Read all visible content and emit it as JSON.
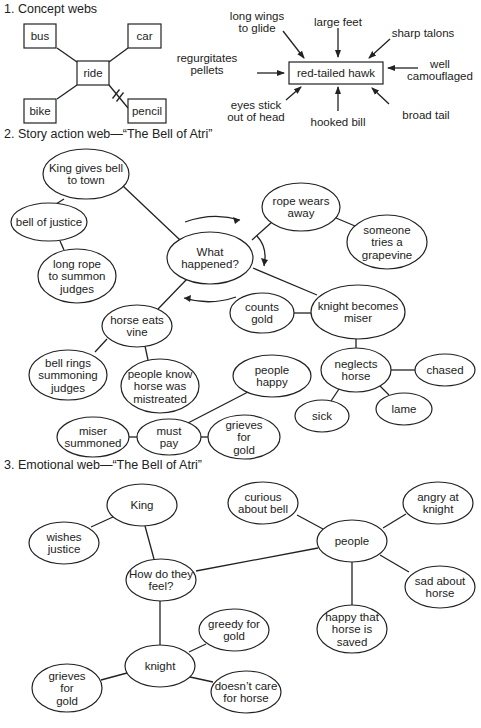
{
  "sections": [
    {
      "id": "concept",
      "heading": "1. Concept webs",
      "heading_pos": [
        4,
        13
      ]
    },
    {
      "id": "story",
      "heading": "2. Story action web—“The Bell of Atri”",
      "heading_pos": [
        4,
        138
      ]
    },
    {
      "id": "emotional",
      "heading": "3. Emotional web—“The Bell of Atri”",
      "heading_pos": [
        4,
        469
      ]
    }
  ],
  "concept_web": {
    "center": {
      "label": "ride",
      "x": 77,
      "y": 61,
      "w": 32,
      "h": 24
    },
    "nodes": [
      {
        "label": "bus",
        "x": 24,
        "y": 24,
        "w": 32,
        "h": 24,
        "edge_from": [
          57,
          48
        ],
        "edge_to": [
          77,
          62
        ]
      },
      {
        "label": "car",
        "x": 128,
        "y": 24,
        "w": 33,
        "h": 24,
        "edge_from": [
          128,
          48
        ],
        "edge_to": [
          109,
          62
        ]
      },
      {
        "label": "bike",
        "x": 24,
        "y": 99,
        "w": 32,
        "h": 24,
        "edge_from": [
          57,
          99
        ],
        "edge_to": [
          77,
          85
        ]
      },
      {
        "label": "pencil",
        "x": 128,
        "y": 99,
        "w": 38,
        "h": 24,
        "edge_from": [
          128,
          108
        ],
        "edge_to": [
          109,
          85
        ],
        "broken": true
      }
    ]
  },
  "hawk_web": {
    "center": {
      "label": "red-tailed hawk",
      "x": 289,
      "y": 62,
      "w": 94,
      "h": 22
    },
    "attributes": [
      {
        "label": [
          "long wings",
          "to glide"
        ],
        "tx": 257,
        "ty": 22,
        "arrow": [
          283,
          31,
          304,
          58
        ]
      },
      {
        "label": [
          "large feet"
        ],
        "tx": 338,
        "ty": 22,
        "arrow": [
          338,
          28,
          338,
          57
        ]
      },
      {
        "label": [
          "sharp talons"
        ],
        "tx": 423,
        "ty": 33,
        "arrow": [
          390,
          39,
          369,
          58
        ]
      },
      {
        "label": [
          "regurgitates",
          "pellets"
        ],
        "tx": 207,
        "ty": 64,
        "arrow": [
          257,
          73,
          284,
          73
        ]
      },
      {
        "label": [
          "well",
          "camouflaged"
        ],
        "tx": 440,
        "ty": 70,
        "arrow": [
          418,
          68,
          388,
          68
        ]
      },
      {
        "label": [
          "eyes stick",
          "out of head"
        ],
        "tx": 256,
        "ty": 111,
        "arrow": [
          286,
          100,
          301,
          87
        ]
      },
      {
        "label": [
          "hooked bill"
        ],
        "tx": 338,
        "ty": 122,
        "arrow": [
          338,
          111,
          338,
          87
        ]
      },
      {
        "label": [
          "broad tail"
        ],
        "tx": 426,
        "ty": 115,
        "arrow": [
          389,
          104,
          372,
          88
        ]
      }
    ]
  },
  "story_web": {
    "nodes": [
      {
        "id": "king",
        "lines": [
          "King gives bell",
          "to town"
        ],
        "cx": 86,
        "cy": 174,
        "rx": 43,
        "ry": 25
      },
      {
        "id": "bell_justice",
        "lines": [
          "bell of justice"
        ],
        "cx": 49,
        "cy": 222,
        "rx": 38,
        "ry": 19
      },
      {
        "id": "long_rope",
        "lines": [
          "long rope",
          "to summon",
          "judges"
        ],
        "cx": 77,
        "cy": 276,
        "rx": 39,
        "ry": 27
      },
      {
        "id": "what_happened",
        "lines": [
          "What",
          "happened?"
        ],
        "cx": 210,
        "cy": 258,
        "rx": 43,
        "ry": 26
      },
      {
        "id": "rope_wears",
        "lines": [
          "rope wears",
          "away"
        ],
        "cx": 301,
        "cy": 207,
        "rx": 39,
        "ry": 24
      },
      {
        "id": "grapevine",
        "lines": [
          "someone",
          "tries a",
          "grapevine"
        ],
        "cx": 387,
        "cy": 242,
        "rx": 40,
        "ry": 27
      },
      {
        "id": "knight_miser",
        "lines": [
          "knight becomes",
          "miser"
        ],
        "cx": 358,
        "cy": 312,
        "rx": 47,
        "ry": 27
      },
      {
        "id": "counts_gold",
        "lines": [
          "counts",
          "gold"
        ],
        "cx": 262,
        "cy": 313,
        "rx": 32,
        "ry": 20
      },
      {
        "id": "horse_eats",
        "lines": [
          "horse eats",
          "vine"
        ],
        "cx": 137,
        "cy": 326,
        "rx": 35,
        "ry": 21
      },
      {
        "id": "bell_rings",
        "lines": [
          "bell rings",
          "summoning",
          "judges"
        ],
        "cx": 68,
        "cy": 375,
        "rx": 39,
        "ry": 25
      },
      {
        "id": "people_know",
        "lines": [
          "people know",
          "horse was",
          "mistreated"
        ],
        "cx": 160,
        "cy": 386,
        "rx": 39,
        "ry": 27
      },
      {
        "id": "neglects_horse",
        "lines": [
          "neglects",
          "horse"
        ],
        "cx": 356,
        "cy": 370,
        "rx": 35,
        "ry": 22
      },
      {
        "id": "chased",
        "lines": [
          "chased"
        ],
        "cx": 445,
        "cy": 370,
        "rx": 30,
        "ry": 16
      },
      {
        "id": "sick",
        "lines": [
          "sick"
        ],
        "cx": 322,
        "cy": 416,
        "rx": 27,
        "ry": 16
      },
      {
        "id": "lame",
        "lines": [
          "lame"
        ],
        "cx": 404,
        "cy": 409,
        "rx": 28,
        "ry": 16
      },
      {
        "id": "people_happy",
        "lines": [
          "people",
          "happy"
        ],
        "cx": 272,
        "cy": 376,
        "rx": 39,
        "ry": 21
      },
      {
        "id": "miser_summoned",
        "lines": [
          "miser",
          "summoned"
        ],
        "cx": 93,
        "cy": 437,
        "rx": 36,
        "ry": 20
      },
      {
        "id": "must_pay",
        "lines": [
          "must",
          "pay"
        ],
        "cx": 169,
        "cy": 437,
        "rx": 32,
        "ry": 18
      },
      {
        "id": "grieves_gold_1",
        "lines": [
          "grieves",
          "for",
          "gold"
        ],
        "cx": 244,
        "cy": 437,
        "rx": 36,
        "ry": 22
      }
    ],
    "edges": [
      [
        64,
        199,
        56,
        204
      ],
      [
        123,
        186,
        180,
        240
      ],
      [
        60,
        241,
        64,
        250
      ],
      [
        252,
        240,
        272,
        222
      ],
      [
        336,
        218,
        355,
        226
      ],
      [
        253,
        268,
        317,
        295
      ],
      [
        294,
        313,
        311,
        313
      ],
      [
        188,
        278,
        158,
        309
      ],
      [
        107,
        339,
        95,
        352
      ],
      [
        145,
        346,
        148,
        360
      ],
      [
        356,
        339,
        356,
        348
      ],
      [
        391,
        370,
        415,
        370
      ],
      [
        339,
        389,
        331,
        401
      ],
      [
        380,
        386,
        389,
        395
      ],
      [
        129,
        437,
        137,
        437
      ],
      [
        188,
        423,
        248,
        392
      ],
      [
        201,
        437,
        208,
        437
      ]
    ],
    "cycle_arrows": [
      {
        "d": "M 185 222 Q 213 212 240 220",
        "head": [
          240,
          220,
          233,
          217,
          235,
          224
        ]
      },
      {
        "d": "M 257 236 Q 268 248 264 266",
        "head": [
          264,
          266,
          261,
          258,
          268,
          260
        ]
      },
      {
        "d": "M 236 297 Q 210 306 184 298",
        "head": [
          184,
          298,
          191,
          295,
          190,
          302
        ]
      }
    ]
  },
  "emotional_web": {
    "nodes": [
      {
        "id": "king2",
        "lines": [
          "King"
        ],
        "cx": 142,
        "cy": 505,
        "rx": 35,
        "ry": 21
      },
      {
        "id": "wishes_justice",
        "lines": [
          "wishes",
          "justice"
        ],
        "cx": 64,
        "cy": 543,
        "rx": 35,
        "ry": 21
      },
      {
        "id": "how_feel",
        "lines": [
          "How do they",
          "feel?"
        ],
        "cx": 161,
        "cy": 580,
        "rx": 35,
        "ry": 21
      },
      {
        "id": "curious",
        "lines": [
          "curious",
          "about bell"
        ],
        "cx": 263,
        "cy": 503,
        "rx": 35,
        "ry": 21
      },
      {
        "id": "angry_knight",
        "lines": [
          "angry at",
          "knight"
        ],
        "cx": 438,
        "cy": 503,
        "rx": 35,
        "ry": 21
      },
      {
        "id": "people2",
        "lines": [
          "people"
        ],
        "cx": 352,
        "cy": 541,
        "rx": 35,
        "ry": 21
      },
      {
        "id": "sad_horse",
        "lines": [
          "sad about",
          "horse"
        ],
        "cx": 440,
        "cy": 587,
        "rx": 35,
        "ry": 21
      },
      {
        "id": "happy_saved",
        "lines": [
          "happy that",
          "horse is",
          "saved"
        ],
        "cx": 352,
        "cy": 629,
        "rx": 35,
        "ry": 24
      },
      {
        "id": "greedy",
        "lines": [
          "greedy for",
          "gold"
        ],
        "cx": 234,
        "cy": 630,
        "rx": 35,
        "ry": 21
      },
      {
        "id": "knight2",
        "lines": [
          "knight"
        ],
        "cx": 160,
        "cy": 666,
        "rx": 35,
        "ry": 21
      },
      {
        "id": "grieves_gold_2",
        "lines": [
          "grieves",
          "for",
          "gold"
        ],
        "cx": 67,
        "cy": 688,
        "rx": 35,
        "ry": 24
      },
      {
        "id": "doesnt_care",
        "lines": [
          "doesn’t care",
          "for horse"
        ],
        "cx": 246,
        "cy": 692,
        "rx": 35,
        "ry": 21
      }
    ],
    "edges": [
      [
        113,
        517,
        91,
        527
      ],
      [
        145,
        526,
        154,
        559
      ],
      [
        196,
        571,
        318,
        548
      ],
      [
        297,
        515,
        323,
        529
      ],
      [
        406,
        514,
        383,
        528
      ],
      [
        380,
        555,
        409,
        572
      ],
      [
        352,
        562,
        352,
        605
      ],
      [
        160,
        601,
        160,
        645
      ],
      [
        189,
        652,
        206,
        644
      ],
      [
        127,
        673,
        101,
        680
      ],
      [
        190,
        677,
        213,
        682
      ]
    ]
  },
  "colors": {
    "ink": "#222222",
    "paper": "#ffffff"
  }
}
